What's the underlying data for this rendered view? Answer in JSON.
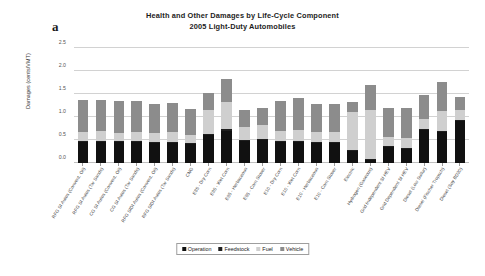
{
  "panel_label": "a",
  "title_lines": [
    "Health and Other Damages by Life-Cycle Component",
    "2005 Light-Duty Automobiles"
  ],
  "chart_data": {
    "type": "bar",
    "subtype": "stacked-column",
    "title": "Health and Other Damages by Life-Cycle Component 2005 Light-Duty Automobiles",
    "xlabel": "",
    "ylabel": "Damages (cents/VMT)",
    "ylim": [
      0.0,
      2.5
    ],
    "ytick_labels": [
      "0.0",
      "0.5",
      "1.0",
      "1.5",
      "2.0",
      "2.5"
    ],
    "ytick_values": [
      0.0,
      0.5,
      1.0,
      1.5,
      2.0,
      2.5
    ],
    "grid": true,
    "legend_position": "bottom-center",
    "categories": [
      "RFG SI Autos (Convent. Oil)",
      "RFG SI Autos (Tar Sands)",
      "CG SI Autos (Convent. Oil)",
      "CG SI Autos (Tar Sands)",
      "RFG SIDI Autos (Convent. Oil)",
      "RFG SIDI Autos (Tar Sands)",
      "CNG",
      "E85 - Dry Corn",
      "E85 - Wet Corn",
      "E85 - Herbaceous",
      "E85 - Corn Stover",
      "E10 - Dry Corn",
      "E10 - Wet Corn",
      "E10 - Herbaceous",
      "E10 - Corn Stover",
      "Electric",
      "Hydrogen (Gaseous)",
      "Grid Independent SI HEV",
      "Grid Dependent SI HEV",
      "Diesel (Low Sulfur)",
      "Diesel (Fischer Tropsch)",
      "Diesel (Soy BD20)"
    ],
    "series": [
      {
        "name": "Operation",
        "color": "#111111",
        "values": [
          0.45,
          0.45,
          0.45,
          0.46,
          0.43,
          0.44,
          0.41,
          0.6,
          0.69,
          0.48,
          0.5,
          0.45,
          0.46,
          0.44,
          0.44,
          0.26,
          0.07,
          0.34,
          0.31,
          0.72,
          0.67,
          0.92
        ]
      },
      {
        "name": "Feedstock",
        "color": "#1f1f1f",
        "values": [
          0.02,
          0.02,
          0.02,
          0.02,
          0.02,
          0.02,
          0.02,
          0.04,
          0.04,
          0.03,
          0.03,
          0.02,
          0.02,
          0.02,
          0.02,
          0.02,
          0.02,
          0.02,
          0.02,
          0.02,
          0.02,
          0.02
        ]
      },
      {
        "name": "Fuel",
        "color": "#cfcfcf",
        "values": [
          0.2,
          0.22,
          0.19,
          0.2,
          0.21,
          0.22,
          0.19,
          0.51,
          0.6,
          0.28,
          0.29,
          0.23,
          0.24,
          0.22,
          0.22,
          0.83,
          1.07,
          0.21,
          0.22,
          0.22,
          0.45,
          0.22
        ]
      },
      {
        "name": "Vehicle",
        "color": "#8c8c8c",
        "values": [
          0.7,
          0.69,
          0.68,
          0.67,
          0.63,
          0.62,
          0.56,
          0.37,
          0.5,
          0.36,
          0.38,
          0.64,
          0.69,
          0.6,
          0.61,
          0.21,
          0.53,
          0.62,
          0.65,
          0.51,
          0.63,
          0.27
        ]
      }
    ],
    "totals": [
      1.37,
      1.38,
      1.34,
      1.35,
      1.29,
      1.3,
      1.18,
      1.52,
      1.83,
      1.15,
      1.2,
      1.34,
      1.41,
      1.28,
      1.29,
      1.32,
      1.69,
      1.19,
      1.2,
      1.47,
      1.77,
      1.43
    ]
  },
  "legend": {
    "items": [
      {
        "label": "Operation",
        "color": "#111111"
      },
      {
        "label": "Feedstock",
        "color": "#1f1f1f"
      },
      {
        "label": "Fuel",
        "color": "#cfcfcf"
      },
      {
        "label": "Vehicle",
        "color": "#8c8c8c"
      }
    ]
  }
}
